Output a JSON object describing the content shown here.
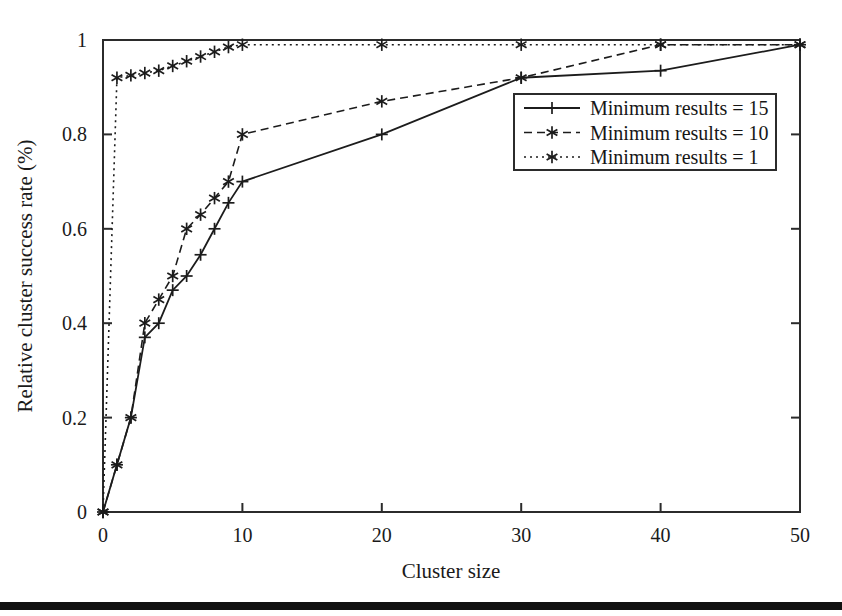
{
  "figure": {
    "width": 842,
    "height": 616,
    "background": "#ffffff",
    "ink_color": "#1c1c1c"
  },
  "chart_data": {
    "type": "line",
    "title": "",
    "subtitle": "",
    "xlabel": "Cluster size",
    "ylabel": "Relative cluster success rate (%)",
    "xlim": [
      0,
      50
    ],
    "ylim": [
      0,
      1
    ],
    "xticks": [
      0,
      10,
      20,
      30,
      40,
      50
    ],
    "xticklabels": [
      "0",
      "10",
      "20",
      "30",
      "40",
      "50"
    ],
    "yticks": [
      0,
      0.2,
      0.4,
      0.6,
      0.8,
      1
    ],
    "yticklabels": [
      "0",
      "0.2",
      "0.4",
      "0.6",
      "0.8",
      "1"
    ],
    "grid": false,
    "legend_position": "center-right",
    "series": [
      {
        "name": "Minimum results = 15",
        "linestyle": "solid",
        "marker": "plus",
        "color": "#1c1c1c",
        "x": [
          0,
          1,
          2,
          3,
          4,
          5,
          6,
          7,
          8,
          9,
          10,
          20,
          30,
          40,
          50
        ],
        "y": [
          0,
          0.1,
          0.2,
          0.37,
          0.4,
          0.47,
          0.5,
          0.545,
          0.6,
          0.655,
          0.7,
          0.8,
          0.92,
          0.935,
          0.99
        ]
      },
      {
        "name": "Minimum results = 10",
        "linestyle": "dashed",
        "marker": "star",
        "color": "#1c1c1c",
        "x": [
          0,
          1,
          2,
          3,
          4,
          5,
          6,
          7,
          8,
          9,
          10,
          20,
          30,
          40,
          50
        ],
        "y": [
          0,
          0.1,
          0.2,
          0.4,
          0.45,
          0.5,
          0.6,
          0.63,
          0.665,
          0.7,
          0.8,
          0.87,
          0.92,
          0.99,
          0.99
        ]
      },
      {
        "name": "Minimum results = 1",
        "linestyle": "dotted",
        "marker": "star",
        "color": "#1c1c1c",
        "x": [
          0,
          1,
          2,
          3,
          4,
          5,
          6,
          7,
          8,
          9,
          10,
          20,
          30,
          40,
          50
        ],
        "y": [
          0,
          0.92,
          0.925,
          0.93,
          0.935,
          0.945,
          0.955,
          0.965,
          0.975,
          0.985,
          0.99,
          0.99,
          0.99,
          0.99,
          0.99
        ]
      }
    ]
  },
  "legend": {
    "entries": [
      {
        "label": "Minimum results = 15",
        "linestyle": "solid",
        "marker": "plus"
      },
      {
        "label": "Minimum results = 10",
        "linestyle": "dashed",
        "marker": "star"
      },
      {
        "label": "Minimum results = 1",
        "linestyle": "dotted",
        "marker": "star"
      }
    ]
  }
}
